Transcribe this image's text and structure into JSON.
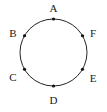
{
  "figure": {
    "type": "circle-with-labeled-points",
    "background_color": "#ffffff",
    "stroke_color": "#262626",
    "label_color": "#1a1a1a",
    "marker_color": "#111111",
    "circle": {
      "center_x": 53.5,
      "center_y": 52.5,
      "radius": 33.5,
      "stroke_width": 1
    },
    "points": [
      {
        "label": "A",
        "angle_deg": 90,
        "marker_x": 53.5,
        "marker_y": 19,
        "label_x": 53.5,
        "label_y": 8
      },
      {
        "label": "F",
        "angle_deg": 30,
        "marker_x": 82.5,
        "marker_y": 35.75,
        "label_x": 93,
        "label_y": 33
      },
      {
        "label": "E",
        "angle_deg": 330,
        "marker_x": 82.5,
        "marker_y": 69.25,
        "label_x": 93,
        "label_y": 78
      },
      {
        "label": "D",
        "angle_deg": 270,
        "marker_x": 53.5,
        "marker_y": 86,
        "label_x": 53.5,
        "label_y": 100
      },
      {
        "label": "C",
        "angle_deg": 210,
        "marker_x": 24.5,
        "marker_y": 69.25,
        "label_x": 13,
        "label_y": 77
      },
      {
        "label": "B",
        "angle_deg": 150,
        "marker_x": 24.5,
        "marker_y": 35.75,
        "label_x": 13,
        "label_y": 33
      }
    ],
    "marker_radius": 1.6
  }
}
